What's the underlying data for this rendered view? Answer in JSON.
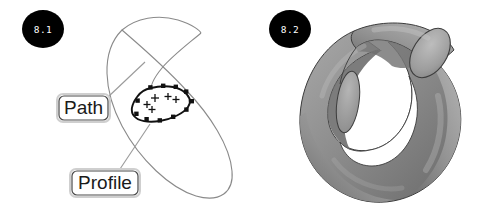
{
  "figure": {
    "background_color": "#ffffff",
    "panels": [
      {
        "id": "panel-8-1",
        "badge_label": "8.1",
        "badge_color": "#000000",
        "badge_text_color": "#ffffff",
        "description": "Sweep construction diagram: large tilted path ellipse with small closed profile loop",
        "callouts": [
          {
            "name": "path",
            "label": "Path"
          },
          {
            "name": "profile",
            "label": "Profile"
          }
        ],
        "geometry": {
          "path_curve_color": "#8a8a8a",
          "profile_curve_color": "#111111",
          "control_point_color": "#111111",
          "control_point_count": 11,
          "cross_marker_count": 5,
          "leader_line_color": "#9a9a9a",
          "callout_border_color": "#4a4a4a"
        }
      },
      {
        "id": "panel-8-2",
        "badge_label": "8.2",
        "badge_color": "#000000",
        "badge_text_color": "#ffffff",
        "description": "Resulting swept 3D solid: open coil torus with flat cut end faces",
        "geometry": {
          "shade_light": "#b4b4b4",
          "shade_mid": "#909090",
          "shade_dark": "#6e6e6e",
          "shade_darkest": "#595959",
          "cap_face_color": "#a6a6a6",
          "outline_color": "#3c3c3c",
          "hole_color": "#ffffff"
        }
      }
    ]
  }
}
